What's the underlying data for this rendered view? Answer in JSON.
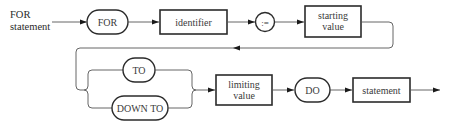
{
  "diagram": {
    "type": "syntax-diagram",
    "title_lines": [
      "FOR",
      "statement"
    ],
    "nodes": {
      "for_keyword": {
        "kind": "terminal",
        "label": "FOR"
      },
      "identifier": {
        "kind": "nonterminal",
        "label": "identifier"
      },
      "assign": {
        "kind": "terminal",
        "label": ":="
      },
      "starting_value": {
        "kind": "nonterminal",
        "label_lines": [
          "starting",
          "value"
        ]
      },
      "to_keyword": {
        "kind": "terminal",
        "label": "TO"
      },
      "downto_keyword": {
        "kind": "terminal",
        "label": "DOWN TO"
      },
      "limiting_value": {
        "kind": "nonterminal",
        "label_lines": [
          "limiting",
          "value"
        ]
      },
      "do_keyword": {
        "kind": "terminal",
        "label": "DO"
      },
      "statement": {
        "kind": "nonterminal",
        "label": "statement"
      }
    },
    "edges": [
      [
        "entry",
        "for_keyword"
      ],
      [
        "for_keyword",
        "identifier"
      ],
      [
        "identifier",
        "assign"
      ],
      [
        "assign",
        "starting_value"
      ],
      [
        "starting_value",
        "to_keyword"
      ],
      [
        "starting_value",
        "downto_keyword"
      ],
      [
        "to_keyword",
        "limiting_value"
      ],
      [
        "downto_keyword",
        "limiting_value"
      ],
      [
        "limiting_value",
        "do_keyword"
      ],
      [
        "do_keyword",
        "statement"
      ],
      [
        "statement",
        "exit"
      ]
    ]
  }
}
